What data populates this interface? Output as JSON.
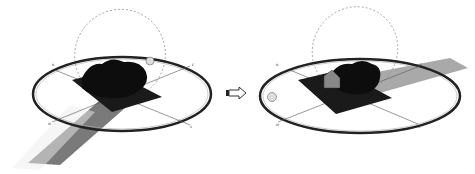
{
  "figure": {
    "panels": [
      {
        "id": "before",
        "description": "Sun-path diagram with terrain model and tree canopy; shadow cast toward lower-left",
        "compass_labels": [
          "N",
          "E",
          "S",
          "W"
        ],
        "sun_position": "upper-right on horizon ring",
        "shadow_direction": "lower-left"
      },
      {
        "id": "after",
        "description": "Sun-path diagram with terrain model, tree canopy and building; shadow cast toward right",
        "compass_labels": [
          "N",
          "E",
          "S",
          "W"
        ],
        "sun_position": "left on horizon ring",
        "shadow_direction": "right"
      }
    ],
    "arrow": {
      "icon": "right-arrow-icon",
      "direction": "right"
    },
    "colors": {
      "terrain": "#1a1a1a",
      "canopy": "#0d0d0d",
      "shadow_left": "#7a7a7a",
      "shadow_right": "#9a9a9a",
      "ring": "#222222",
      "sun_path": "#999999",
      "sun": "#dddddd"
    }
  }
}
